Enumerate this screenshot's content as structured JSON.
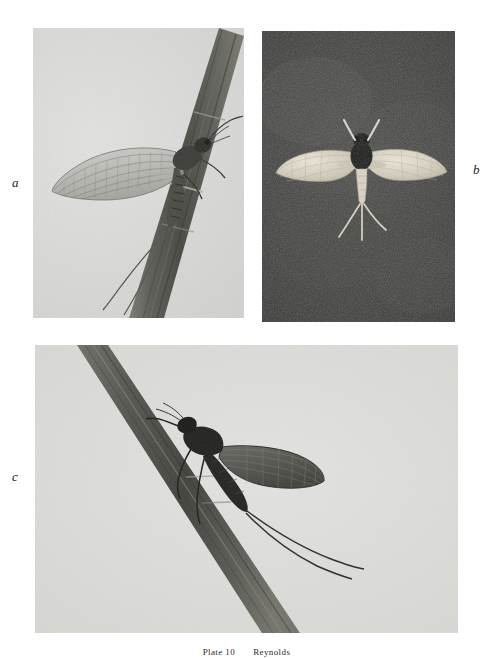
{
  "plate": {
    "width": 493,
    "height": 658,
    "background_color": "#ffffff",
    "caption": {
      "plate_label": "Plate 10",
      "credit": "Reynolds",
      "clipped": true
    },
    "panels": [
      {
        "id": "a",
        "letter": "a",
        "letter_position": "left-middle",
        "subject": "mayfly-at-rest-on-reed",
        "description": "Adult mayfly (dun) clinging to a broad reed blade that runs from lower-centre to upper-right; two long cerci trail down-left; forewings held upright showing dense venation.",
        "background_tone": "pale-grey-sky",
        "background_color": "#d6d6d3",
        "subject_color": "#3a3a38",
        "stem_color": "#5a5a56"
      },
      {
        "id": "b",
        "letter": "b",
        "letter_position": "right-middle",
        "subject": "mayfly-in-flight-dorsal",
        "description": "Mayfly photographed in flight from above against a dark ground; pale translucent wings spread horizontally, dark thorax and head, three pale tails splayed below.",
        "background_tone": "dark-grey-ground",
        "background_color": "#3d3d3b",
        "subject_color": "#ded9cc",
        "thorax_color": "#1b1b1a"
      },
      {
        "id": "c",
        "letter": "c",
        "letter_position": "left-middle",
        "subject": "mayfly-at-rest-on-stem",
        "description": "Mayfly in silhouette perched head-up on a dark stem running diagonally from upper-left to lower-right; wings folded back over the abdomen, two long tails curving to the right.",
        "background_tone": "pale-grey-sky",
        "background_color": "#d8d8d5",
        "subject_color": "#2d2d2b",
        "stem_color": "#55554f"
      }
    ]
  }
}
